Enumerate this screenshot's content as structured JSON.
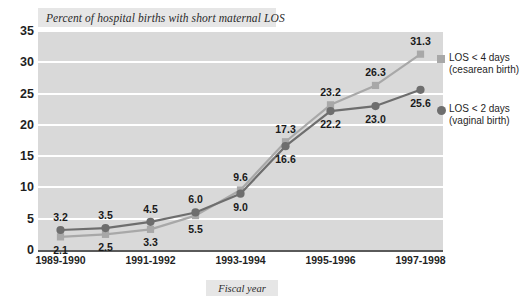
{
  "chart_data": {
    "type": "line",
    "title": "Percent of hospital births with short maternal LOS",
    "xlabel": "Fiscal year",
    "ylabel": "",
    "ylim": [
      0,
      35
    ],
    "yticks": [
      0,
      5,
      10,
      15,
      20,
      25,
      30,
      35
    ],
    "grid": true,
    "legend_position": "right",
    "x": [
      "1989-1990",
      "",
      "1991-1992",
      "",
      "1993-1994",
      "",
      "1995-1996",
      "",
      "1997-1998"
    ],
    "xtick_labels": [
      "1989-1990",
      "1991-1992",
      "1993-1994",
      "1995-1996",
      "1997-1998"
    ],
    "xtick_indices": [
      0,
      2,
      4,
      6,
      8
    ],
    "series": [
      {
        "name": "LOS < 4 days (cesarean birth)",
        "legend_line1": "LOS < 4 days",
        "legend_line2": "(cesarean birth)",
        "color": "#a8a8a8",
        "marker": "square",
        "values": [
          2.1,
          2.5,
          3.3,
          5.5,
          9.6,
          17.3,
          23.2,
          26.3,
          31.3
        ],
        "labels": [
          "2.1",
          "2.5",
          "3.3",
          "5.5",
          "9.6",
          "17.3",
          "23.2",
          "26.3",
          "31.3"
        ],
        "label_positions": [
          "below",
          "below",
          "below",
          "below",
          "above",
          "above",
          "above",
          "above",
          "above"
        ]
      },
      {
        "name": "LOS < 2 days (vaginal birth)",
        "legend_line1": "LOS < 2 days",
        "legend_line2": "(vaginal birth)",
        "color": "#6e6e6e",
        "marker": "circle",
        "values": [
          3.2,
          3.5,
          4.5,
          6.0,
          9.0,
          16.6,
          22.2,
          23.0,
          25.6
        ],
        "labels": [
          "3.2",
          "3.5",
          "4.5",
          "6.0",
          "9.0",
          "16.6",
          "22.2",
          "23.0",
          "25.6"
        ],
        "label_positions": [
          "above",
          "above",
          "above",
          "above",
          "below",
          "below",
          "below",
          "below",
          "below"
        ]
      }
    ]
  }
}
